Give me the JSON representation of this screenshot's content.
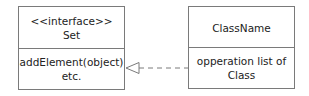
{
  "diagram": {
    "type": "uml-class-diagram",
    "interface_box": {
      "stereotype": "<<interface>>",
      "name": "Set",
      "operations_line1": "addElement(object)",
      "operations_line2": "etc."
    },
    "class_box": {
      "name": "ClassName",
      "operations_line1": "opperation list of",
      "operations_line2": "Class"
    },
    "relationship": {
      "kind": "realization",
      "from": "ClassName",
      "to": "Set",
      "style": "dashed line with hollow triangle arrowhead"
    },
    "colors": {
      "border": "#7a7a7a",
      "text": "#222222",
      "background": "#ffffff"
    }
  }
}
